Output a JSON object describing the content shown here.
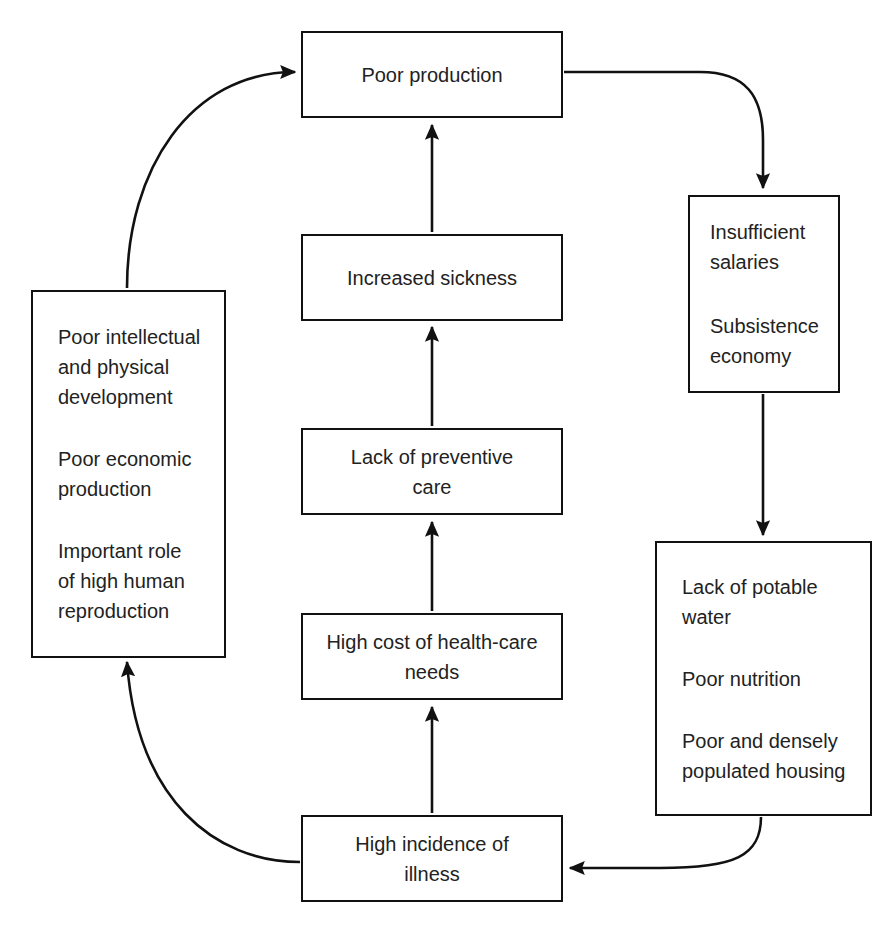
{
  "diagram": {
    "type": "flow-cycle",
    "background_color": "#ffffff",
    "line_color": "#111111",
    "text_color": "#222222"
  },
  "nodes": {
    "poor_production": {
      "label": "Poor production",
      "paragraphs": [
        "Poor production"
      ],
      "align": "center"
    },
    "increased_sickness": {
      "label": "Increased sickness",
      "paragraphs": [
        "Increased sickness"
      ],
      "align": "center"
    },
    "lack_preventive_care": {
      "label": "Lack of preventive care",
      "paragraphs": [
        "Lack of preventive\ncare"
      ],
      "align": "center"
    },
    "high_cost_health_care": {
      "label": "High cost of health-care needs",
      "paragraphs": [
        "High cost of health-care\nneeds"
      ],
      "align": "center"
    },
    "high_incidence_illness": {
      "label": "High incidence of illness",
      "paragraphs": [
        "High incidence of\nillness"
      ],
      "align": "center"
    },
    "poor_development": {
      "label": "Poor intellectual and physical development",
      "paragraphs": [
        "Poor intellectual\nand physical\ndevelopment",
        "Poor economic\nproduction",
        "Important role\nof high human\nreproduction"
      ],
      "align": "left"
    },
    "insufficient_salaries": {
      "label": "Insufficient salaries",
      "paragraphs": [
        "Insufficient\nsalaries",
        "Subsistence\neconomy"
      ],
      "align": "left"
    },
    "lack_potable_water": {
      "label": "Lack of potable water",
      "paragraphs": [
        "Lack of potable\nwater",
        "Poor nutrition",
        "Poor and densely\npopulated housing"
      ],
      "align": "left"
    }
  },
  "edges": [
    {
      "name": "poor-development-to-poor-production",
      "from": "poor_development",
      "to": "poor_production",
      "style": "curved"
    },
    {
      "name": "poor-production-to-insufficient-salaries",
      "from": "poor_production",
      "to": "insufficient_salaries",
      "style": "curved"
    },
    {
      "name": "insufficient-salaries-to-lack-potable-water",
      "from": "insufficient_salaries",
      "to": "lack_potable_water",
      "style": "straight"
    },
    {
      "name": "lack-potable-water-to-high-incidence-illness",
      "from": "lack_potable_water",
      "to": "high_incidence_illness",
      "style": "curved"
    },
    {
      "name": "high-incidence-illness-to-poor-development",
      "from": "high_incidence_illness",
      "to": "poor_development",
      "style": "curved"
    },
    {
      "name": "high-incidence-illness-to-high-cost-health-care",
      "from": "high_incidence_illness",
      "to": "high_cost_health_care",
      "style": "straight"
    },
    {
      "name": "high-cost-health-care-to-lack-preventive-care",
      "from": "high_cost_health_care",
      "to": "lack_preventive_care",
      "style": "straight"
    },
    {
      "name": "lack-preventive-care-to-increased-sickness",
      "from": "lack_preventive_care",
      "to": "increased_sickness",
      "style": "straight"
    },
    {
      "name": "increased-sickness-to-poor-production",
      "from": "increased_sickness",
      "to": "poor_production",
      "style": "straight"
    }
  ]
}
